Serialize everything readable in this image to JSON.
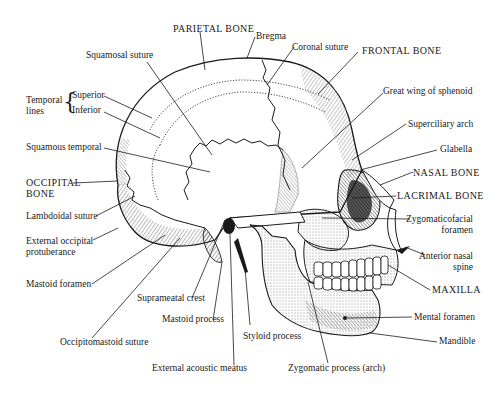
{
  "diagram": {
    "ink_color": "#1a1a1a",
    "background_color": "#ffffff",
    "labels": {
      "parietal_bone": "PARIETAL BONE",
      "bregma": "Bregma",
      "coronal_suture": "Coronal suture",
      "frontal_bone": "FRONTAL BONE",
      "squamosal_suture": "Squamosal suture",
      "temporal_lines": "Temporal lines",
      "temporal_lines_line1": "Temporal",
      "temporal_lines_line2": "lines",
      "superior": "Superior",
      "inferior": "Inferior",
      "great_wing_of_sphenoid": "Great wing of sphenoid",
      "superciliary_arch": "Superciliary arch",
      "glabella": "Glabella",
      "squamous_temporal": "Squamous temporal",
      "occipital_bone_line1": "OCCIPITAL",
      "occipital_bone_line2": "BONE",
      "nasal_bone": "NASAL BONE",
      "lacrimal_bone": "LACRIMAL BONE",
      "lambdoidal_suture": "Lambdoidal suture",
      "zygomaticofacial_foramen_line1": "Zygomaticofacial",
      "zygomaticofacial_foramen_line2": "foramen",
      "external_occipital_protuberance_line1": "External occipital",
      "external_occipital_protuberance_line2": "protuberance",
      "anterior_nasal_spine_line1": "Anterior nasal",
      "anterior_nasal_spine_line2": "spine",
      "mastoid_foramen": "Mastoid foramen",
      "maxilla": "MAXILLA",
      "suprameatal_crest": "Suprameatal crest",
      "mastoid_process": "Mastoid process",
      "styloid_process": "Styloid process",
      "mental_foramen": "Mental foramen",
      "occipitomastoid_suture": "Occipitomastoid suture",
      "mandible": "Mandible",
      "external_acoustic_meatus": "External acoustic meatus",
      "zygomatic_process_arch": "Zygomatic process (arch)"
    }
  }
}
